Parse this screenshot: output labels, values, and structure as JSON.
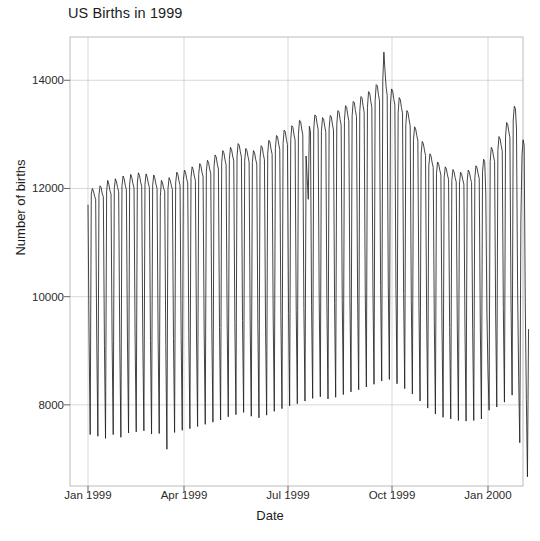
{
  "chart_data": {
    "type": "line",
    "title": "US Births in 1999",
    "xlabel": "Date",
    "ylabel": "Number of births",
    "grid": true,
    "legend": "none",
    "xlim": [
      "1999-01-01",
      "2000-01-01"
    ],
    "ylim": [
      6500,
      14800
    ],
    "yticks": [
      8000,
      10000,
      12000,
      14000
    ],
    "ytick_labels": [
      "8000",
      "10000",
      "12000",
      "14000"
    ],
    "xticks": [
      "1999-01-01",
      "1999-04-01",
      "1999-07-01",
      "1999-10-01",
      "2000-01-01"
    ],
    "xtick_labels": [
      "Jan 1999",
      "Apr 1999",
      "Jul 1999",
      "Oct 1999",
      "Jan 2000"
    ],
    "line_color": "#222222",
    "series_name": "Daily US births 1999",
    "x_start_index": 0,
    "x_count": 365,
    "values": [
      11700,
      9200,
      7450,
      11900,
      12000,
      11950,
      11860,
      11800,
      9150,
      7420,
      11880,
      12050,
      12020,
      11900,
      11850,
      9100,
      7380,
      11950,
      12150,
      12080,
      11960,
      11900,
      9180,
      7450,
      12000,
      12180,
      12120,
      12020,
      11940,
      9130,
      7400,
      12050,
      12230,
      12180,
      12060,
      11980,
      9200,
      7480,
      12080,
      12260,
      12200,
      12090,
      12010,
      9220,
      7500,
      12100,
      12290,
      12240,
      12120,
      12040,
      9240,
      7520,
      12080,
      12270,
      12210,
      12100,
      12020,
      9190,
      7460,
      12060,
      12250,
      12190,
      12080,
      12000,
      9210,
      7470,
      11850,
      12150,
      12100,
      12000,
      11950,
      9120,
      7180,
      12000,
      12200,
      12150,
      12060,
      11980,
      9230,
      7490,
      12100,
      12300,
      12260,
      12140,
      12060,
      9260,
      7530,
      12150,
      12340,
      12300,
      12180,
      12100,
      9280,
      7560,
      12200,
      12400,
      12350,
      12230,
      12150,
      9310,
      7600,
      12260,
      12460,
      12420,
      12300,
      12220,
      9350,
      7640,
      12320,
      12520,
      12480,
      12360,
      12280,
      9390,
      7680,
      12400,
      12620,
      12580,
      12450,
      12360,
      9430,
      7720,
      12480,
      12700,
      12660,
      12530,
      12440,
      9480,
      7780,
      12540,
      12760,
      12720,
      12600,
      12510,
      9520,
      7820,
      12600,
      12830,
      12800,
      12680,
      12580,
      9560,
      7860,
      12520,
      12740,
      12700,
      12590,
      12490,
      9480,
      7790,
      12480,
      12700,
      12660,
      12540,
      12450,
      9450,
      7760,
      12560,
      12790,
      12760,
      12630,
      12530,
      9510,
      7810,
      12650,
      12890,
      12860,
      12730,
      12630,
      9570,
      7880,
      12740,
      12980,
      12950,
      12820,
      12720,
      9630,
      7930,
      12830,
      13080,
      13050,
      12910,
      12810,
      9690,
      7980,
      12900,
      13160,
      13130,
      12990,
      12890,
      9740,
      8020,
      13000,
      13260,
      13240,
      13100,
      12990,
      9800,
      8070,
      12600,
      12200,
      11800,
      13150,
      13050,
      9850,
      8120,
      13100,
      13360,
      13340,
      13200,
      13090,
      9880,
      8150,
      13050,
      13310,
      13280,
      13150,
      13040,
      9840,
      8110,
      13090,
      13350,
      13330,
      13190,
      13080,
      9870,
      8140,
      13180,
      13440,
      13420,
      13280,
      13170,
      9930,
      8190,
      13260,
      13530,
      13500,
      13360,
      13250,
      9980,
      8240,
      13340,
      13610,
      13590,
      13440,
      13330,
      10030,
      8280,
      13420,
      13700,
      13680,
      13530,
      13410,
      10080,
      8330,
      13500,
      13790,
      13770,
      13620,
      13500,
      10140,
      8380,
      13620,
      13920,
      13900,
      13740,
      13620,
      10210,
      8440,
      14000,
      14520,
      14180,
      13880,
      13720,
      10250,
      8470,
      13560,
      13840,
      13800,
      13660,
      13540,
      10150,
      8390,
      13400,
      13680,
      13640,
      13500,
      13390,
      10060,
      8300,
      13180,
      13440,
      13400,
      13270,
      13160,
      9950,
      8200,
      12900,
      13140,
      13100,
      12980,
      12880,
      9800,
      8070,
      12640,
      12870,
      12830,
      12710,
      12610,
      9660,
      7940,
      12420,
      12640,
      12600,
      12480,
      12390,
      9540,
      7830,
      12280,
      12490,
      12450,
      12340,
      12250,
      9470,
      7770,
      12200,
      12400,
      12360,
      12250,
      12170,
      9430,
      7740,
      12150,
      12350,
      12310,
      12200,
      12120,
      9400,
      7710,
      12100,
      12300,
      12260,
      12160,
      12080,
      9380,
      7700,
      12140,
      12340,
      12300,
      12190,
      12110,
      9390,
      7710,
      12200,
      12420,
      12380,
      12270,
      12180,
      9420,
      7740,
      12300,
      12540,
      12500,
      11900,
      9700,
      8600,
      7900,
      12500,
      12760,
      12720,
      12600,
      12500,
      9680,
      7960,
      12700,
      12960,
      12920,
      12800,
      12690,
      9780,
      8050,
      12950,
      13220,
      13180,
      13050,
      12940,
      9920,
      8180,
      13250,
      13520,
      13480,
      13100,
      10200,
      8500,
      7300,
      11400,
      12600,
      12900,
      12800,
      9900,
      8100,
      6670,
      9400
    ]
  }
}
